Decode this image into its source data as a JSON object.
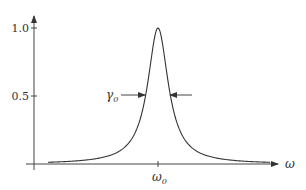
{
  "chart_data": {
    "type": "line",
    "title": "",
    "xlabel": "ω",
    "ylabel": "",
    "x_ticks": [
      {
        "label": "ω0",
        "sub": "0",
        "base": "ω"
      }
    ],
    "y_ticks": [
      "1.0",
      "0.5"
    ],
    "ylim": [
      0,
      1.0
    ],
    "peak": {
      "x": "ω0",
      "y": 1.0
    },
    "annotations": [
      {
        "text": "γ0",
        "base": "γ",
        "sub": "0",
        "meaning": "full width at half maximum",
        "y": 0.5
      }
    ],
    "series": [
      {
        "name": "resonance",
        "shape": "lorentzian",
        "center": "ω0",
        "fwhm": "γ0"
      }
    ]
  },
  "axis": {
    "x_label": "ω",
    "y_tick_1": "1.0",
    "y_tick_half": "0.5",
    "x_tick_base": "ω",
    "x_tick_sub": "0"
  },
  "annotation": {
    "width_base": "γ",
    "width_sub": "0"
  },
  "colors": {
    "line": "#333333",
    "background": "#ffffff"
  }
}
